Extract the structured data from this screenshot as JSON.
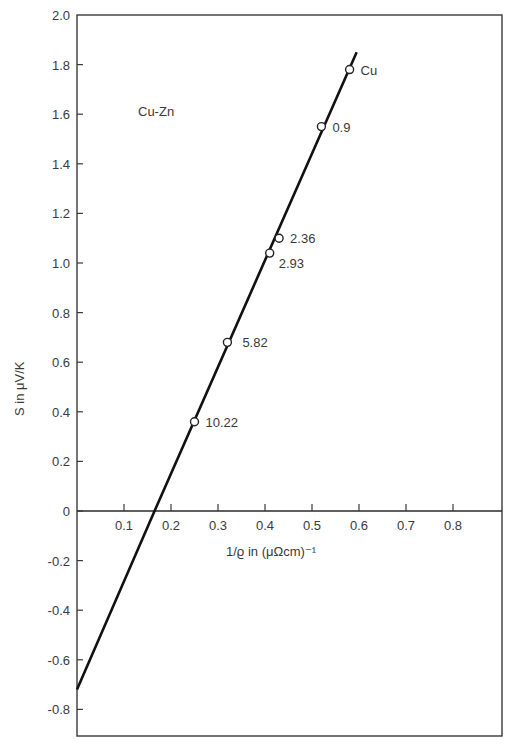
{
  "chart_data": {
    "type": "scatter",
    "title": "Cu-Zn",
    "xlabel": "1/ϱ in (μΩcm)⁻¹",
    "ylabel": "S in μV/K",
    "xlim": [
      0,
      0.9
    ],
    "ylim": [
      -0.9,
      2.0
    ],
    "grid": false,
    "x_ticks": [
      "0.1",
      "0.2",
      "0.3",
      "0.4",
      "0.5",
      "0.6",
      "0.7",
      "0.8"
    ],
    "y_ticks": [
      "2.0",
      "1.8",
      "1.6",
      "1.4",
      "1.2",
      "1.0",
      "0.8",
      "0.6",
      "0.4",
      "0.2",
      "0",
      "-0.2",
      "-0.4",
      "-0.6",
      "-0.8"
    ],
    "series": [
      {
        "name": "Cu-Zn alloys",
        "marker": "open-circle",
        "points": [
          {
            "label": "Cu",
            "x": 0.58,
            "y": 1.78
          },
          {
            "label": "0.9",
            "x": 0.52,
            "y": 1.55
          },
          {
            "label": "2.36",
            "x": 0.43,
            "y": 1.1
          },
          {
            "label": "2.93",
            "x": 0.41,
            "y": 1.04
          },
          {
            "label": "5.82",
            "x": 0.32,
            "y": 0.68
          },
          {
            "label": "10.22",
            "x": 0.25,
            "y": 0.36
          }
        ]
      },
      {
        "name": "linear fit",
        "type": "line",
        "x": [
          0.0,
          0.165,
          0.595
        ],
        "y": [
          -0.72,
          0.0,
          1.85
        ]
      }
    ]
  }
}
